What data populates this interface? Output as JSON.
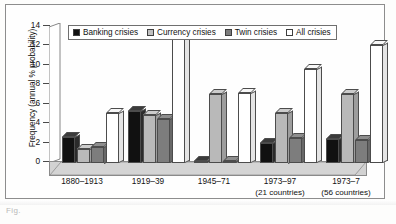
{
  "figure": {
    "caption_partial": "Fig.",
    "frame": true
  },
  "legend": {
    "position": "top-inside",
    "items": [
      {
        "label": "Banking crisies",
        "key": "banking",
        "color": "#111111",
        "swatch": "filled-black-square"
      },
      {
        "label": "Currency crisies",
        "key": "currency",
        "color": "#c0c0c0",
        "swatch": "filled-lightgray-square"
      },
      {
        "label": "Twin crisies",
        "key": "twin",
        "color": "#7d7d7d",
        "swatch": "filled-darkgray-square"
      },
      {
        "label": "All crisies",
        "key": "all",
        "color": "#ffffff",
        "swatch": "outlined-white-square"
      }
    ]
  },
  "axes": {
    "ylabel": "Frequency (annual % probability)",
    "xlabel": "",
    "yticks": [
      0,
      2,
      4,
      6,
      8,
      10,
      12,
      14
    ],
    "ylim": [
      0,
      14
    ],
    "grid": false
  },
  "xcategories": [
    {
      "line1": "1880–1913",
      "line2": ""
    },
    {
      "line1": "1919–39",
      "line2": ""
    },
    {
      "line1": "1945–71",
      "line2": ""
    },
    {
      "line1": "1973–97",
      "line2": "(21 countries)"
    },
    {
      "line1": "1973–7",
      "line2": "(56 countries)"
    }
  ],
  "chart_data": {
    "type": "bar",
    "title": "",
    "subtitle": "",
    "xlabel": "",
    "ylabel": "Frequency (annual % probability)",
    "ylim": [
      0,
      14
    ],
    "yticks": [
      0,
      2,
      4,
      6,
      8,
      10,
      12,
      14
    ],
    "grid": false,
    "legend_position": "top-inside",
    "style": "3d-grouped-bars",
    "categories": [
      "1880–1913",
      "1919–39",
      "1945–71",
      "1973–97 (21 countries)",
      "1973–7 (56 countries)"
    ],
    "series": [
      {
        "name": "Banking crisies",
        "color": "#111111",
        "values": [
          2.7,
          5.4,
          0.2,
          2.1,
          2.5
        ]
      },
      {
        "name": "Currency crisies",
        "color": "#c0c0c0",
        "values": [
          1.4,
          4.9,
          7.1,
          5.2,
          7.1
        ]
      },
      {
        "name": "Twin crisies",
        "color": "#7d7d7d",
        "values": [
          1.7,
          4.5,
          0.2,
          2.6,
          2.4
        ]
      },
      {
        "name": "All crisies",
        "color": "#ffffff",
        "values": [
          5.1,
          13.2,
          7.2,
          9.7,
          12.1
        ]
      }
    ]
  }
}
